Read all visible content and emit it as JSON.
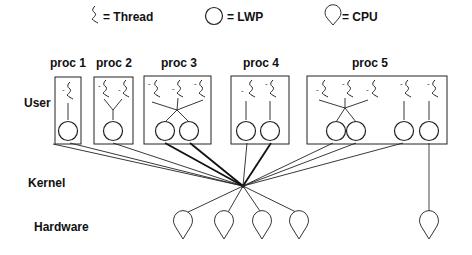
{
  "legend": {
    "thread_label": "= Thread",
    "lwp_label": "= LWP",
    "cpu_label": "= CPU"
  },
  "layers": {
    "user": "User",
    "kernel": "Kernel",
    "hardware": "Hardware"
  },
  "processes": [
    {
      "label": "proc 1",
      "threads": 1,
      "lwps": 1
    },
    {
      "label": "proc 2",
      "threads": 2,
      "lwps": 1
    },
    {
      "label": "proc 3",
      "threads": 3,
      "lwps": 2
    },
    {
      "label": "proc 4",
      "threads": 2,
      "lwps": 2
    },
    {
      "label": "proc 5",
      "threads": 5,
      "lwps": 3,
      "bound_lwp": 1
    }
  ],
  "hardware": {
    "shared_cpus": 4,
    "bound_cpus": 1
  }
}
